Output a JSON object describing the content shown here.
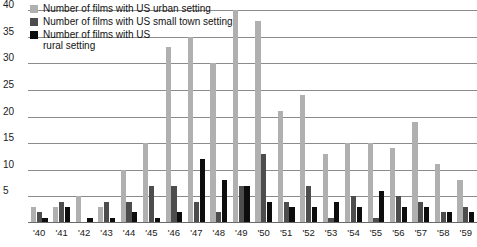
{
  "chart_data": {
    "type": "bar",
    "title": "",
    "subtitle": "",
    "xlabel": "",
    "ylabel": "",
    "ylim": [
      0,
      40
    ],
    "yticks": [
      5,
      10,
      15,
      20,
      25,
      30,
      35,
      40
    ],
    "grid": true,
    "legend_position": "top-left",
    "categories": [
      "'40",
      "'41",
      "'42",
      "'43",
      "'44",
      "'45",
      "'46",
      "'47",
      "'48",
      "'49",
      "'50",
      "'51",
      "'52",
      "'53",
      "'54",
      "'55",
      "'56",
      "'57",
      "'58",
      "'59"
    ],
    "series": [
      {
        "name": "Number of films with US urban setting",
        "color": "#b0b0b0",
        "values": [
          3,
          3,
          5,
          3,
          10,
          15,
          33,
          35,
          30,
          40,
          38,
          21,
          24,
          13,
          15,
          15,
          14,
          19,
          11,
          8
        ]
      },
      {
        "name": "Number of films with US small town setting",
        "color": "#4d4d4d",
        "values": [
          2,
          4,
          0,
          4,
          4,
          7,
          7,
          4,
          2,
          7,
          13,
          4,
          7,
          1,
          5,
          1,
          5,
          4,
          2,
          3
        ]
      },
      {
        "name": "Number of films with US rural setting",
        "color": "#0d0d0d",
        "values": [
          1,
          3,
          1,
          1,
          2,
          1,
          2,
          12,
          8,
          7,
          4,
          3,
          3,
          4,
          3,
          6,
          3,
          3,
          2,
          2
        ]
      }
    ]
  },
  "legend": {
    "items": [
      {
        "label": "Number of films with US urban setting",
        "swatch": "urban"
      },
      {
        "label": "Number of films with US small town setting",
        "swatch": "small"
      },
      {
        "label": "Number of films with US rural setting",
        "swatch": "rural"
      }
    ]
  }
}
